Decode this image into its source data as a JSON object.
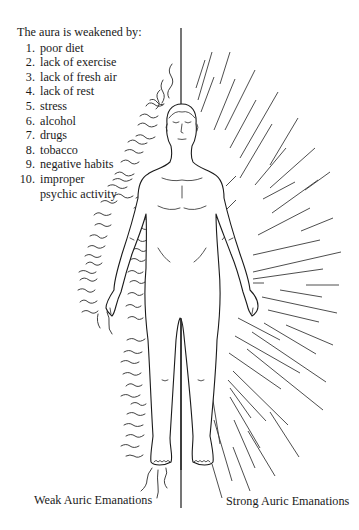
{
  "list": {
    "title": "The aura is weakened by:",
    "items": [
      {
        "num": "1.",
        "text": "poor diet"
      },
      {
        "num": "2.",
        "text": "lack of exercise"
      },
      {
        "num": "3.",
        "text": "lack of fresh air"
      },
      {
        "num": "4.",
        "text": "lack of rest"
      },
      {
        "num": "5.",
        "text": "stress"
      },
      {
        "num": "6.",
        "text": "alcohol"
      },
      {
        "num": "7.",
        "text": "drugs"
      },
      {
        "num": "8.",
        "text": "tobacco"
      },
      {
        "num": "9.",
        "text": "negative habits"
      },
      {
        "num": "10.",
        "text": "improper"
      }
    ],
    "item10_continuation": "psychic activity"
  },
  "captions": {
    "left": "Weak Auric Emanations",
    "right": "Strong Auric Emanations"
  },
  "figure": {
    "left_aura_style": "wavy-lines",
    "right_aura_style": "straight-rays",
    "line_color": "#1a1a1a",
    "ray_color": "#3a3a3a"
  }
}
